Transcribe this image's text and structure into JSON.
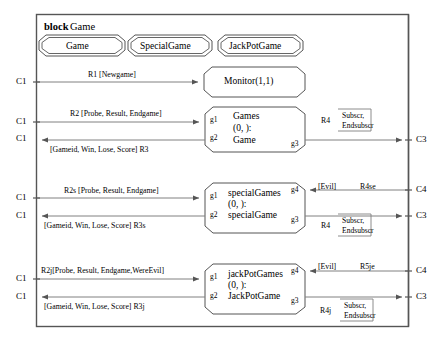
{
  "diagram": {
    "kind": "sdl-block-diagram",
    "block_keyword": "block",
    "block_name": "Game",
    "frame_color": "#555555",
    "line_color": "#808080",
    "text_color": "#000000"
  },
  "type_boxes": [
    {
      "name": "game-type",
      "label": "Game"
    },
    {
      "name": "specialgame-type",
      "label": "SpecialGame"
    },
    {
      "name": "jackpotgame-type",
      "label": "JackPotGame"
    }
  ],
  "agents": [
    {
      "name": "monitor-agent",
      "lines": [
        "Monitor(1,1)"
      ],
      "gates": []
    },
    {
      "name": "games-agent",
      "lines": [
        "Games",
        "(0, ):",
        "Game"
      ],
      "gates": [
        {
          "id": "g1",
          "pos": "left-top"
        },
        {
          "id": "g2",
          "pos": "left-bottom"
        },
        {
          "id": "g3",
          "pos": "right-bottom"
        }
      ]
    },
    {
      "name": "specialgames-agent",
      "lines": [
        "specialGames",
        "(0, ):",
        "specialGame"
      ],
      "gates": [
        {
          "id": "g1",
          "pos": "left-top"
        },
        {
          "id": "g2",
          "pos": "left-bottom"
        },
        {
          "id": "g4",
          "pos": "right-top"
        },
        {
          "id": "g3",
          "pos": "right-bottom"
        }
      ]
    },
    {
      "name": "jackpotgames-agent",
      "lines": [
        "jackPotGames",
        "(0, ):",
        "JackPotGame"
      ],
      "gates": [
        {
          "id": "g1",
          "pos": "left-top"
        },
        {
          "id": "g2",
          "pos": "left-bottom"
        },
        {
          "id": "g4",
          "pos": "right-top"
        },
        {
          "id": "g3",
          "pos": "right-bottom"
        }
      ]
    }
  ],
  "gateways": {
    "left": [
      {
        "name": "gateway-c1-monitor",
        "label": "C1"
      },
      {
        "name": "gateway-c1-games-in",
        "label": "C1"
      },
      {
        "name": "gateway-c1-games-out",
        "label": "C1"
      },
      {
        "name": "gateway-c1-special-in",
        "label": "C1"
      },
      {
        "name": "gateway-c1-special-out",
        "label": "C1"
      },
      {
        "name": "gateway-c1-jackpot-in",
        "label": "C1"
      },
      {
        "name": "gateway-c1-jackpot-out",
        "label": "C1"
      }
    ],
    "right": [
      {
        "name": "gateway-c3-games",
        "label": "C3"
      },
      {
        "name": "gateway-c4-special",
        "label": "C4"
      },
      {
        "name": "gateway-c3-special",
        "label": "C3"
      },
      {
        "name": "gateway-c4-jackpot",
        "label": "C4"
      },
      {
        "name": "gateway-c3-jackpot",
        "label": "C3"
      }
    ]
  },
  "channels": [
    {
      "name": "channel-r1",
      "id": "R1",
      "signals": "[Newgame]",
      "text": "R1 [Newgame]"
    },
    {
      "name": "channel-r2",
      "id": "R2",
      "signals": "[Probe, Result, Endgame]",
      "text": "R2 [Probe, Result, Endgame]"
    },
    {
      "name": "channel-r3",
      "id": "R3",
      "signals": "[Gameid, Win, Lose, Score]",
      "text": "[Gameid, Win, Lose, Score]   R3"
    },
    {
      "name": "channel-r2s",
      "id": "R2s",
      "signals": "[Probe, Result, Endgame]",
      "text": "R2s   [Probe, Result, Endgame]"
    },
    {
      "name": "channel-r3s",
      "id": "R3s",
      "signals": "[Gameid, Win, Lose, Score]",
      "text": "[Gameid, Win, Lose, Score]    R3s"
    },
    {
      "name": "channel-r2j",
      "id": "R2j",
      "signals": "[Probe, Result, Endgame,WereEvil]",
      "text": "R2j[Probe, Result, Endgame,WereEvil]"
    },
    {
      "name": "channel-r3j",
      "id": "R3j",
      "signals": "[Gameid, Win, Lose, Score]",
      "text": "[Gameid, Win, Lose, Score]       R3j"
    },
    {
      "name": "channel-r4-games",
      "id": "R4",
      "signals": "Subscr, Endsubscr",
      "text": "R4"
    },
    {
      "name": "channel-r4-special",
      "id": "R4",
      "signals": "Subscr, Endsubscr",
      "text": "R4"
    },
    {
      "name": "channel-r4j-jackpot",
      "id": "R4j",
      "signals": "Subscr, Endsubscr",
      "text": "R4j"
    },
    {
      "name": "channel-r4se",
      "id": "R4se",
      "signals": "[Evil]",
      "text": "R4se"
    },
    {
      "name": "channel-r5je",
      "id": "R5je",
      "signals": "[Evil]",
      "text": "R5je"
    }
  ],
  "signal_lists": [
    {
      "name": "signal-list-r4-games",
      "line1": "Subscr,",
      "line2": "Endsubscr"
    },
    {
      "name": "signal-list-r4-special",
      "line1": "Subscr,",
      "line2": "Endsubscr"
    },
    {
      "name": "signal-list-r4j",
      "line1": "Subscr,",
      "line2": "Endsubscr"
    }
  ],
  "evil_labels": [
    {
      "name": "evil-label-special",
      "text": "[Evil]"
    },
    {
      "name": "evil-label-jackpot",
      "text": "[Evil]"
    }
  ]
}
